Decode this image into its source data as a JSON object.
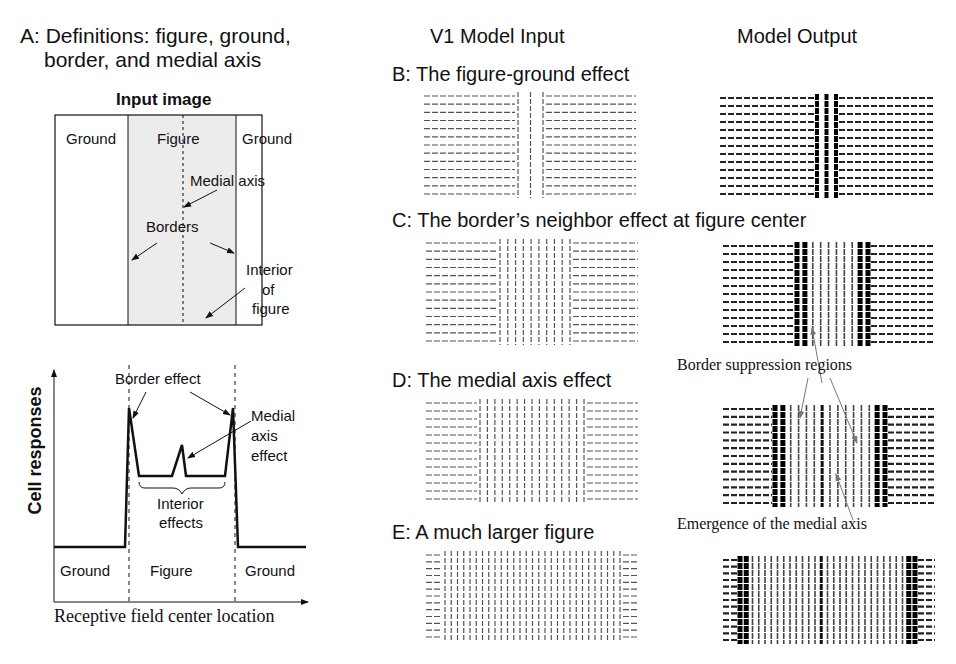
{
  "panel_a": {
    "title_line1": "A: Definitions: figure, ground,",
    "title_line2": "border, and medial axis",
    "input_image": {
      "heading": "Input image",
      "labels": {
        "ground_left": "Ground",
        "figure": "Figure",
        "ground_right": "Ground",
        "medial_axis": "Medial axis",
        "borders": "Borders",
        "interior_l1": "Interior",
        "interior_l2": "of",
        "interior_l3": "figure"
      },
      "figure_fill": "#ececec"
    },
    "response_plot": {
      "ylabel": "Cell responses",
      "xlabel": "Receptive field center location",
      "labels": {
        "border_effect": "Border effect",
        "medial_l1": "Medial",
        "medial_l2": "axis",
        "medial_l3": "effect",
        "interior_l1": "Interior",
        "interior_l2": "effects",
        "ground_left": "Ground",
        "figure": "Figure",
        "ground_right": "Ground"
      }
    }
  },
  "column_headers": {
    "input": "V1 Model Input",
    "output": "Model Output"
  },
  "panels": [
    {
      "id": "B",
      "title": "B: The figure-ground effect"
    },
    {
      "id": "C",
      "title": "C: The border’s neighbor effect at figure center"
    },
    {
      "id": "D",
      "title": "D: The medial axis effect"
    },
    {
      "id": "E",
      "title": "E: A much larger figure"
    }
  ],
  "annotations": {
    "border_suppression": "Border suppression regions",
    "medial_emergence": "Emergence of the medial axis"
  },
  "chart_data": {
    "type": "line",
    "xlabel": "Receptive field center location",
    "ylabel": "Cell responses",
    "regions": [
      "Ground",
      "Figure",
      "Ground"
    ],
    "x": [
      0,
      0.28,
      0.3,
      0.37,
      0.5,
      0.53,
      0.55,
      0.57,
      0.65,
      0.72,
      0.735,
      1.0
    ],
    "values": [
      0.2,
      0.2,
      0.85,
      0.54,
      0.54,
      0.69,
      0.54,
      0.54,
      0.54,
      0.85,
      0.2,
      0.2
    ],
    "annotations": [
      "Border effect",
      "Medial axis effect",
      "Interior effects"
    ],
    "grid": false
  },
  "stimuli": {
    "rows": 13,
    "B": {
      "input": {
        "x": 424,
        "y": 96,
        "w": 212,
        "h": 98,
        "fig_x0": 518,
        "fig_x1": 543,
        "vlines": 3
      },
      "output": {
        "x": 720,
        "y": 98,
        "w": 214,
        "h": 96,
        "fig_x0": 817,
        "fig_x1": 836,
        "vlines": 3
      }
    },
    "C": {
      "input": {
        "x": 426,
        "y": 243,
        "w": 212,
        "h": 98,
        "fig_x0": 500,
        "fig_x1": 570,
        "vlines": 10
      },
      "output": {
        "x": 723,
        "y": 246,
        "w": 212,
        "h": 96,
        "fig_x0": 797,
        "fig_x1": 868,
        "vlines": 10
      }
    },
    "D": {
      "input": {
        "x": 426,
        "y": 403,
        "w": 212,
        "h": 96,
        "fig_x0": 480,
        "fig_x1": 584,
        "vlines": 15
      },
      "output": {
        "x": 723,
        "y": 409,
        "w": 212,
        "h": 94,
        "fig_x0": 775,
        "fig_x1": 885,
        "vlines": 15
      }
    },
    "E": {
      "input": {
        "x": 426,
        "y": 555,
        "w": 212,
        "h": 82,
        "fig_x0": 445,
        "fig_x1": 620,
        "vlines": 29
      },
      "output": {
        "x": 723,
        "y": 560,
        "w": 212,
        "h": 80,
        "fig_x0": 740,
        "fig_x1": 915,
        "vlines": 29
      }
    }
  },
  "colors": {
    "ink": "#111111",
    "gray_arrow": "#777777",
    "figure_fill": "#ececec"
  }
}
